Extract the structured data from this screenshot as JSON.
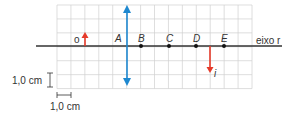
{
  "diagram": {
    "grid": {
      "x0": 57,
      "y0": 5,
      "cols": 14,
      "rows": 6,
      "cell": 13.93,
      "color": "#d0d0d0"
    },
    "axis": {
      "y": 46,
      "x_start": 36,
      "x_end": 282,
      "label": "eixo r",
      "color": "#333333"
    },
    "lens": {
      "x": 127,
      "y_top": 5,
      "y_bottom": 86,
      "color": "#1e88d0"
    },
    "object": {
      "label": "o",
      "x": 85,
      "tip_y": 32,
      "color": "#e53a2a"
    },
    "image": {
      "label": "i",
      "x": 210,
      "tip_y": 73,
      "color": "#e53a2a"
    },
    "points": [
      {
        "label": "A",
        "x": 120,
        "marker": false
      },
      {
        "label": "B",
        "x": 141,
        "marker": true
      },
      {
        "label": "C",
        "x": 169,
        "marker": true
      },
      {
        "label": "D",
        "x": 196,
        "marker": true
      },
      {
        "label": "E",
        "x": 224,
        "marker": true
      }
    ],
    "scale": {
      "vertical_label": "1,0 cm",
      "horizontal_label": "1,0 cm"
    }
  }
}
